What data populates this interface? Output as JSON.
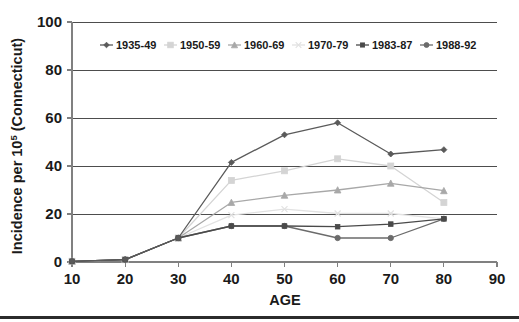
{
  "chart_data": {
    "type": "line",
    "title": "",
    "xlabel": "AGE",
    "ylabel": "Incidence per 10",
    "ylabel_superscript": "5",
    "ylabel_suffix": " (Connecticut)",
    "x": [
      10,
      20,
      30,
      40,
      50,
      60,
      70,
      80
    ],
    "xlim": [
      10,
      90
    ],
    "ylim": [
      0,
      100
    ],
    "xticks": [
      "10",
      "20",
      "30",
      "40",
      "50",
      "60",
      "70",
      "80",
      "90"
    ],
    "yticks": [
      "0",
      "20",
      "40",
      "60",
      "80",
      "100"
    ],
    "grid": "horizontal",
    "legend_position": "top-inside",
    "series": [
      {
        "name": "1935-49",
        "color": "#5a5a5a",
        "marker": "diamond",
        "values": [
          0.3,
          1.0,
          10.0,
          41.5,
          53.0,
          58.0,
          45.0,
          46.8
        ]
      },
      {
        "name": "1950-59",
        "color": "#d4d4d4",
        "marker": "square",
        "values": [
          0.3,
          1.0,
          10.0,
          34.0,
          38.0,
          43.0,
          40.0,
          24.8
        ]
      },
      {
        "name": "1960-69",
        "color": "#a8a8a8",
        "marker": "triangle",
        "values": [
          0.3,
          1.0,
          10.0,
          24.8,
          27.8,
          30.0,
          32.8,
          29.7
        ]
      },
      {
        "name": "1970-79",
        "color": "#e2e2e2",
        "marker": "cross",
        "values": [
          0.3,
          1.0,
          10.0,
          19.5,
          22.0,
          20.2,
          20.2,
          18.0
        ]
      },
      {
        "name": "1983-87",
        "color": "#4a4a4a",
        "marker": "small-square",
        "values": [
          0.3,
          1.0,
          10.0,
          15.0,
          15.0,
          14.7,
          15.8,
          18.0
        ]
      },
      {
        "name": "1988-92",
        "color": "#6b6b6b",
        "marker": "circle",
        "values": [
          0.3,
          1.0,
          10.0,
          15.0,
          15.0,
          10.0,
          10.0,
          18.0
        ]
      }
    ]
  },
  "figure": {
    "bottom_rule_visible": true
  }
}
